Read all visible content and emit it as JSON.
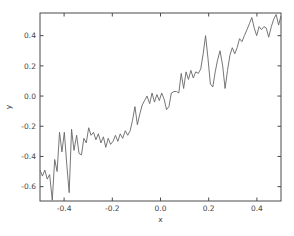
{
  "figure": {
    "background_color": "#ffffff"
  },
  "chart_data": {
    "type": "line",
    "title": "",
    "xlabel": "x",
    "ylabel": "y",
    "xlim": [
      -0.5,
      0.5
    ],
    "ylim": [
      -0.695,
      0.55
    ],
    "x_ticks": [
      -0.4,
      -0.2,
      0.0,
      0.2,
      0.4
    ],
    "x_tick_labels": [
      "-0.4",
      "-0.2",
      "0.0",
      "0.2",
      "0.4"
    ],
    "y_ticks": [
      -0.6,
      -0.4,
      -0.2,
      0.0,
      0.2,
      0.4
    ],
    "y_tick_labels": [
      "-0.6",
      "-0.4",
      "-0.2",
      "0.0",
      "0.2",
      "0.4"
    ],
    "grid": false,
    "legend": "none",
    "line_color": "#666666",
    "axis_color": "#4a4a4a",
    "tick_direction": "in",
    "series": [
      {
        "name": "noisy-linear-trend",
        "x": [
          -0.5,
          -0.49,
          -0.48,
          -0.47,
          -0.46,
          -0.449,
          -0.439,
          -0.429,
          -0.419,
          -0.409,
          -0.399,
          -0.389,
          -0.379,
          -0.369,
          -0.359,
          -0.348,
          -0.338,
          -0.328,
          -0.318,
          -0.308,
          -0.298,
          -0.288,
          -0.278,
          -0.268,
          -0.258,
          -0.247,
          -0.237,
          -0.227,
          -0.217,
          -0.207,
          -0.197,
          -0.187,
          -0.177,
          -0.167,
          -0.157,
          -0.146,
          -0.136,
          -0.126,
          -0.116,
          -0.106,
          -0.096,
          -0.086,
          -0.076,
          -0.066,
          -0.056,
          -0.045,
          -0.035,
          -0.025,
          -0.015,
          -0.005,
          0.005,
          0.015,
          0.025,
          0.035,
          0.045,
          0.056,
          0.066,
          0.076,
          0.086,
          0.096,
          0.106,
          0.116,
          0.126,
          0.136,
          0.146,
          0.157,
          0.167,
          0.177,
          0.187,
          0.197,
          0.207,
          0.217,
          0.227,
          0.237,
          0.247,
          0.258,
          0.268,
          0.278,
          0.288,
          0.298,
          0.308,
          0.318,
          0.328,
          0.338,
          0.348,
          0.359,
          0.369,
          0.379,
          0.389,
          0.399,
          0.409,
          0.419,
          0.429,
          0.439,
          0.449,
          0.46,
          0.47,
          0.48,
          0.49,
          0.5
        ],
        "y": [
          -0.49,
          -0.53,
          -0.49,
          -0.55,
          -0.52,
          -0.69,
          -0.42,
          -0.5,
          -0.24,
          -0.37,
          -0.24,
          -0.45,
          -0.64,
          -0.22,
          -0.36,
          -0.26,
          -0.38,
          -0.39,
          -0.28,
          -0.31,
          -0.21,
          -0.26,
          -0.24,
          -0.29,
          -0.25,
          -0.31,
          -0.27,
          -0.34,
          -0.28,
          -0.32,
          -0.3,
          -0.26,
          -0.3,
          -0.25,
          -0.28,
          -0.23,
          -0.26,
          -0.23,
          -0.16,
          -0.07,
          -0.19,
          -0.12,
          -0.06,
          -0.03,
          0.0,
          -0.05,
          0.02,
          -0.04,
          0.01,
          -0.03,
          0.02,
          -0.02,
          -0.09,
          -0.07,
          0.02,
          0.03,
          0.03,
          0.02,
          0.15,
          0.05,
          0.16,
          0.11,
          0.17,
          0.12,
          0.16,
          0.15,
          0.18,
          0.28,
          0.4,
          0.25,
          0.08,
          0.06,
          0.16,
          0.24,
          0.3,
          0.2,
          0.05,
          0.17,
          0.27,
          0.32,
          0.28,
          0.32,
          0.38,
          0.36,
          0.4,
          0.44,
          0.48,
          0.52,
          0.45,
          0.4,
          0.46,
          0.44,
          0.46,
          0.45,
          0.39,
          0.46,
          0.51,
          0.54,
          0.47,
          0.53
        ]
      }
    ]
  }
}
